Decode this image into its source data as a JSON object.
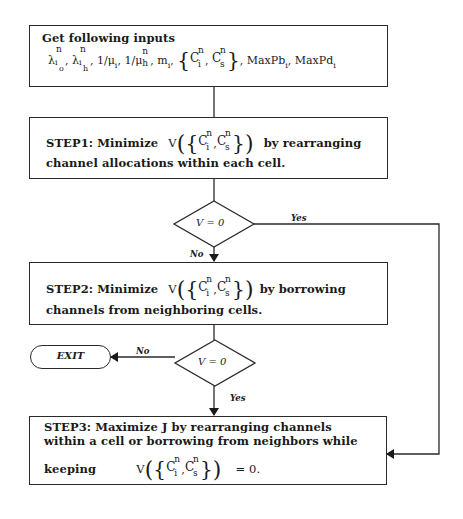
{
  "diagram": {
    "type": "flowchart",
    "nodes": {
      "inputs": {
        "heading": "Get following inputs",
        "params_text": "λ_io^n, λ_ih^n, 1/μ_i, 1/μ_h^n, m_i, {C_i^n, C_s^n}, MaxPb_i, MaxPd_i",
        "lambda": "λ",
        "mu": "μ",
        "one_over": "1/",
        "m": "m",
        "C": "C",
        "n": "n",
        "i": "i",
        "o": "o",
        "h": "h",
        "s": "s",
        "maxpb": "MaxPb",
        "maxpd": "MaxPd",
        "comma": ","
      },
      "step1": {
        "prefix": "STEP1: Minimize",
        "V": "V",
        "suffix": "by rearranging",
        "line2": "channel allocations within each cell."
      },
      "decision1": {
        "condition": "V = 0",
        "yes_label": "Yes",
        "no_label": "No"
      },
      "step2": {
        "prefix": "STEP2: Minimize",
        "V": "V",
        "suffix": "by borrowing",
        "line2": "channels from neighboring cells."
      },
      "decision2": {
        "condition": "V = 0",
        "yes_label": "Yes",
        "no_label": "No"
      },
      "exit": {
        "label": "EXIT"
      },
      "step3": {
        "line1": "STEP3: Maximize J by rearranging channels",
        "line2": "within a cell or borrowing from neighbors while",
        "keeping": "keeping",
        "V": "V",
        "equals": "= 0."
      }
    },
    "edges": [
      {
        "from": "inputs",
        "to": "step1",
        "label": ""
      },
      {
        "from": "step1",
        "to": "decision1",
        "label": ""
      },
      {
        "from": "decision1",
        "to": "step2",
        "label": "No"
      },
      {
        "from": "decision1",
        "to": "step3",
        "label": "Yes"
      },
      {
        "from": "step2",
        "to": "decision2",
        "label": ""
      },
      {
        "from": "decision2",
        "to": "exit",
        "label": "No"
      },
      {
        "from": "decision2",
        "to": "step3",
        "label": "Yes"
      }
    ],
    "colors": {
      "stroke": "#2a2a2a",
      "background": "#ffffff",
      "text": "#1a1a1a"
    }
  }
}
